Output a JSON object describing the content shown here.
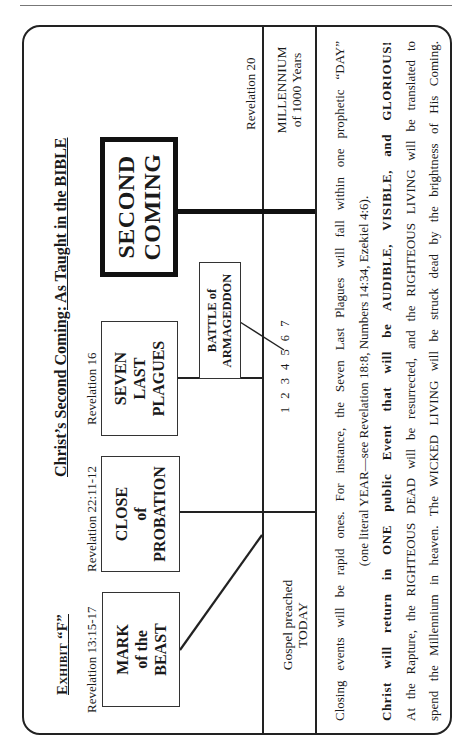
{
  "page": {
    "orientation": "rotated-90-ccw"
  },
  "header": {
    "exhibit_prefix": "Exhibit",
    "exhibit_letter": "“F”",
    "title": "Christ’s Second Coming:  As Taught in the BIBLE"
  },
  "events": [
    {
      "id": "mark",
      "reference": "Revelation 13:15-17",
      "lines": [
        "MARK",
        "of the",
        "BEAST"
      ]
    },
    {
      "id": "close",
      "reference": "Revelation 22:11-12",
      "lines": [
        "CLOSE",
        "of",
        "PROBATION"
      ]
    },
    {
      "id": "plagues",
      "reference": "Revelation 16",
      "lines": [
        "SEVEN",
        "LAST",
        "PLAGUES"
      ]
    },
    {
      "id": "battle",
      "reference": "",
      "lines": [
        "BATTLE of",
        "ARMAGEDDON"
      ]
    },
    {
      "id": "second",
      "reference": "",
      "lines": [
        "SECOND",
        "COMING"
      ]
    }
  ],
  "timeline": {
    "plague_numbers": "1 2 3 4 5 6 7",
    "present": {
      "lines": [
        "Gospel preached",
        "TODAY"
      ]
    },
    "millennium": {
      "reference": "Revelation 20",
      "lines": [
        "MILLENNIUM",
        "of 1000 Years"
      ]
    }
  },
  "notes": [
    {
      "text": "Closing events will be rapid ones. For instance, the Seven Last Plagues will fall within one prophetic “DAY”",
      "style": "normal"
    },
    {
      "text": "(one literal YEAR—see Revelation 18:8, Numbers 14:34, Ezekiel 4:6).",
      "style": "center"
    },
    {
      "text": "Christ will return in ONE public Event that will be AUDIBLE, VISIBLE, and GLORIOUS!",
      "style": "bold"
    },
    {
      "text": "At the Rapture, the RIGHTEOUS DEAD will be resurrected, and the RIGHTEOUS LIVING will be translated to",
      "style": "normal"
    },
    {
      "text": "spend the Millennium in heaven. The WICKED LIVING will be struck dead by the brightness of His Coming.",
      "style": "normal"
    }
  ],
  "colors": {
    "ink": "#1a1a1a",
    "paper": "#ffffff"
  }
}
